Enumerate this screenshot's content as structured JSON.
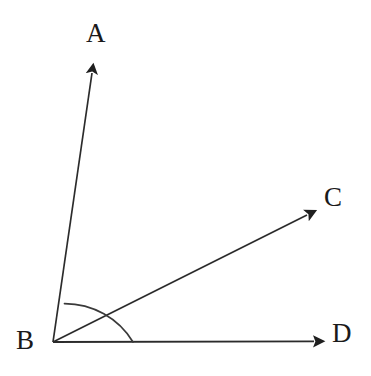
{
  "figure": {
    "kind": "geometry-diagram",
    "background_color": "#ffffff",
    "stroke_color": "#1f1f1f",
    "label_color": "#1a1a1a"
  },
  "labels": {
    "a": "A",
    "b": "B",
    "c": "C",
    "d": "D"
  },
  "geometry": {
    "vertex": {
      "name": "B",
      "x": 53,
      "y": 342
    },
    "rays": [
      {
        "name": "ray-BA",
        "from_label": "B",
        "to_label": "A",
        "tip_x": 94,
        "tip_y": 62,
        "angle_deg": 81.7
      },
      {
        "name": "ray-BC",
        "from_label": "B",
        "to_label": "C",
        "tip_x": 318,
        "tip_y": 209,
        "angle_deg": 26.5
      },
      {
        "name": "ray-BD",
        "from_label": "B",
        "to_label": "D",
        "tip_x": 326,
        "tip_y": 341,
        "angle_deg": 0
      }
    ],
    "arc": {
      "name": "angle-arc-ABD",
      "center_x": 53,
      "center_y": 342,
      "radius": 80,
      "start_angle_deg": 0,
      "end_angle_deg": 81.7
    }
  }
}
